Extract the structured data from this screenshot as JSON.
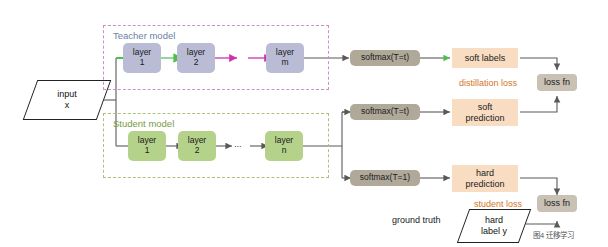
{
  "figure": {
    "caption": "图4 迁移学习"
  },
  "input": {
    "line1": "input",
    "line2": "x"
  },
  "teacher": {
    "title": "Teacher model",
    "layers": [
      {
        "line1": "layer",
        "line2": "1"
      },
      {
        "line1": "layer",
        "line2": "2"
      },
      {
        "line1": "layer",
        "line2": "m"
      }
    ]
  },
  "student": {
    "title": "Student model",
    "ellipsis": "...",
    "layers": [
      {
        "line1": "layer",
        "line2": "1"
      },
      {
        "line1": "layer",
        "line2": "2"
      },
      {
        "line1": "layer",
        "line2": "n"
      }
    ]
  },
  "softmax": {
    "teacher": "softmax(T=t)",
    "student_soft": "softmax(T=t)",
    "student_hard": "softmax(T=1)"
  },
  "outputs": {
    "soft_labels": {
      "line1": "soft labels",
      "line2": ""
    },
    "soft_prediction": {
      "line1": "soft",
      "line2": "prediction"
    },
    "hard_prediction": {
      "line1": "hard",
      "line2": "prediction"
    }
  },
  "losses": {
    "distillation_label": "distillation loss",
    "student_label": "student loss",
    "loss_fn_top": "loss fn",
    "loss_fn_bottom": "loss fn"
  },
  "ground_truth": {
    "label": "ground truth",
    "line1": "hard",
    "line2": "label y"
  },
  "colors": {
    "teacher_layer": "#b9bcd4",
    "student_layer": "#b5d28a",
    "softmax_box": "#b0a99a",
    "output_box": "#f8ddc2",
    "loss_fn_box": "#c8c1b4",
    "loss_text": "#d4762a",
    "teacher_border": "#cf8fc4",
    "student_border": "#a9c37a",
    "teacher_title": "#6b7fa3",
    "student_title": "#7a9b3f",
    "arrow_default": "#595959",
    "arrow_green": "#5cc05c",
    "arrow_magenta": "#cc33aa"
  }
}
